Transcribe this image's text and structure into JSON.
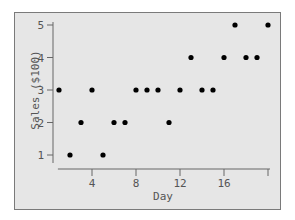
{
  "chart_data": {
    "type": "scatter",
    "title": "",
    "xlabel": "Day",
    "ylabel": "Sales ($100)",
    "x": [
      1,
      2,
      3,
      4,
      5,
      6,
      7,
      8,
      9,
      10,
      11,
      12,
      13,
      14,
      15,
      16,
      17,
      18,
      19,
      20
    ],
    "y": [
      3,
      1,
      2,
      3,
      1,
      2,
      2,
      3,
      3,
      3,
      2,
      3,
      4,
      3,
      3,
      4,
      5,
      4,
      4,
      5
    ],
    "xticks": [
      4,
      8,
      12,
      16,
      20
    ],
    "xtick_labels": [
      "4",
      "8",
      "12",
      "16",
      ""
    ],
    "yticks": [
      1,
      2,
      3,
      4,
      5
    ],
    "ytick_labels": [
      "1",
      "2",
      "3",
      "4",
      "5"
    ],
    "xlim": [
      0.6,
      20.4
    ],
    "ylim": [
      0.7,
      5.2
    ],
    "grid": false,
    "legend": null,
    "colors": {
      "background": "#e6e6e6",
      "point": "#000000",
      "axis": "#666666"
    }
  }
}
